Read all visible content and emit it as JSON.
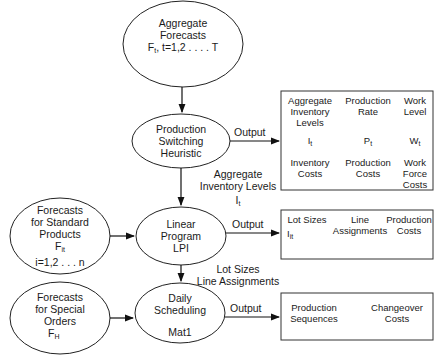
{
  "nodes": {
    "aggregate_forecasts": {
      "line1": "Aggregate",
      "line2": "Forecasts",
      "line3_var": "F",
      "line3_sub": "t",
      "line3_rest": ", t=1,2 . . . . T"
    },
    "production_switching": {
      "line1": "Production",
      "line2": "Switching",
      "line3": "Heuristic"
    },
    "standard_products": {
      "line1": "Forecasts",
      "line2": "for Standard",
      "line3": "Products",
      "var": "F",
      "var_sub": "it",
      "range": "i=1,2 . . . n"
    },
    "linear_program": {
      "line1": "Linear",
      "line2": "Program",
      "line3": "LPI"
    },
    "special_orders": {
      "line1": "Forecasts",
      "line2": "for Special",
      "line3": "Orders",
      "var": "F",
      "var_sub": "H"
    },
    "daily_scheduling": {
      "line1": "Daily",
      "line2": "Scheduling",
      "line3": "Mat1"
    }
  },
  "edges": {
    "output1": "Output",
    "output2": "Output",
    "output3": "Output",
    "agg_inv_line1": "Aggregate",
    "agg_inv_line2": "Inventory Levels",
    "agg_inv_var": "I",
    "agg_inv_sub": "t",
    "lot_line1": "Lot Sizes",
    "lot_line2": "Line Assignments"
  },
  "box1": {
    "c1_h1": "Aggregate",
    "c1_h2": "Inventory",
    "c1_h3": "Levels",
    "c2_h1": "Production",
    "c2_h2": "Rate",
    "c3_h1": "Work",
    "c3_h2": "Level",
    "c1_var": "I",
    "c1_sub": "t",
    "c2_var": "P",
    "c2_sub": "t",
    "c3_var": "W",
    "c3_sub": "t",
    "c1_f1": "Inventory",
    "c1_f2": "Costs",
    "c2_f1": "Production",
    "c2_f2": "Costs",
    "c3_f1": "Work",
    "c3_f2": "Force",
    "c3_f3": "Costs"
  },
  "box2": {
    "c1_h1": "Lot Sizes",
    "c1_var": "I",
    "c1_sub": "it",
    "c2_h1": "Line",
    "c2_h2": "Assignments",
    "c3_h1": "Production",
    "c3_h2": "Costs"
  },
  "box3": {
    "c1_h1": "Production",
    "c1_h2": "Sequences",
    "c2_h1": "Changeover",
    "c2_h2": "Costs"
  }
}
